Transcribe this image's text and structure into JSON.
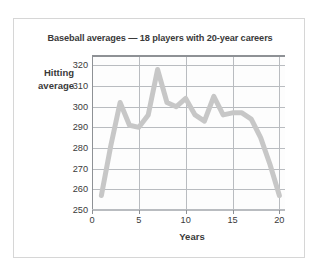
{
  "chart_data": {
    "type": "line",
    "title": "Baseball averages — 18 players with 20-year careers",
    "xlabel": "Years",
    "ylabel_line1": "Hitting",
    "ylabel_line2": "average",
    "ylabel": "Hitting average",
    "xlim": [
      0,
      20.6
    ],
    "ylim": [
      250,
      325
    ],
    "xticks": [
      0,
      5,
      10,
      15,
      20
    ],
    "xtick_labels": [
      "0",
      "5",
      "10",
      "15",
      "20"
    ],
    "yticks": [
      250,
      260,
      270,
      280,
      290,
      300,
      310,
      320
    ],
    "ytick_labels": [
      "250",
      "260",
      "270",
      "280",
      "290",
      "300",
      "310",
      "320"
    ],
    "grid": true,
    "legend": "none",
    "series": [
      {
        "name": "Hitting average",
        "color": "#c7c7c7",
        "line_width": 5,
        "x": [
          1,
          2,
          3,
          4,
          5,
          6,
          7,
          8,
          9,
          10,
          11,
          12,
          13,
          14,
          15,
          16,
          17,
          18,
          19,
          20
        ],
        "values": [
          257,
          281,
          302,
          291,
          290,
          296,
          318,
          302,
          300,
          304,
          296,
          293,
          305,
          296,
          297,
          297,
          294,
          285,
          272,
          257
        ]
      }
    ]
  },
  "figure": {
    "border_color": "#d6d6d6",
    "background": "#ffffff",
    "grid_color": "#b9bcc0",
    "axis_color": "#8e9195",
    "text_color": "#3a3a3a"
  }
}
